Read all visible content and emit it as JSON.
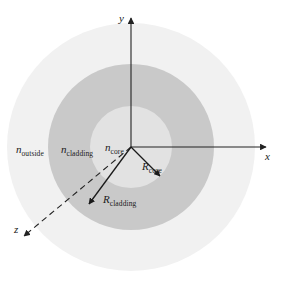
{
  "figure": {
    "background_color": "#ffffff"
  },
  "regions": {
    "outside": {
      "label_var": "n",
      "label_sub": "outside",
      "fill_color": "#f1f1f1",
      "radius": 124
    },
    "cladding": {
      "label_var": "n",
      "label_sub": "cladding",
      "fill_color": "#c9c9c9",
      "radius": 83
    },
    "core": {
      "label_var": "n",
      "label_sub": "core",
      "fill_color": "#e2e2e2",
      "radius": 41
    }
  },
  "radii_annotations": {
    "core": {
      "label_var": "R",
      "label_sub": "core"
    },
    "cladding": {
      "label_var": "R",
      "label_sub": "cladding"
    }
  },
  "axes": {
    "x": {
      "label": "x",
      "direction": "right"
    },
    "y": {
      "label": "y",
      "direction": "up"
    },
    "z": {
      "label": "z",
      "direction": "lower-left",
      "style": "dashed"
    },
    "origin": {
      "x": 131,
      "y": 147
    },
    "line_color": "#222222"
  }
}
